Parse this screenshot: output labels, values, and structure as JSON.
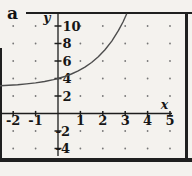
{
  "figure_label": "a",
  "colors": {
    "paper": "#f4f2ee",
    "ink": "#1d1d1d",
    "curve": "#4d4d4d",
    "grid_dot": "#777777"
  },
  "chart_data": {
    "type": "line",
    "title": "",
    "xlabel": "x",
    "ylabel": "y",
    "x_axis_range": [
      -2.6,
      5.6
    ],
    "y_axis_range": [
      -5.5,
      11.4
    ],
    "grid": "dotted points at integer x and even y intersections",
    "legend": "none",
    "x_ticks": [
      {
        "label": "-2",
        "value": -2
      },
      {
        "label": "-1",
        "value": -1
      },
      {
        "label": "1",
        "value": 1
      },
      {
        "label": "2",
        "value": 2
      },
      {
        "label": "3",
        "value": 3
      },
      {
        "label": "4",
        "value": 4
      },
      {
        "label": "5",
        "value": 5
      }
    ],
    "y_ticks": [
      {
        "label": "10",
        "value": 10
      },
      {
        "label": "8",
        "value": 8
      },
      {
        "label": "6",
        "value": 6
      },
      {
        "label": "4",
        "value": 4
      },
      {
        "label": "2",
        "value": 2
      },
      {
        "label": "-2",
        "value": -2
      },
      {
        "label": "-4",
        "value": -4
      }
    ],
    "series": [
      {
        "name": "exponential curve",
        "function": "y = 2^x + 3",
        "horizontal_asymptote": 3,
        "y_intercept": 4,
        "points": [
          [
            -2.63,
            3.16
          ],
          [
            -2.2,
            3.22
          ],
          [
            -1.8,
            3.29
          ],
          [
            -1.4,
            3.38
          ],
          [
            -1.0,
            3.5
          ],
          [
            -0.6,
            3.66
          ],
          [
            -0.2,
            3.87
          ],
          [
            0,
            4
          ],
          [
            0.3,
            4.23
          ],
          [
            0.6,
            4.52
          ],
          [
            0.9,
            4.87
          ],
          [
            1.2,
            5.3
          ],
          [
            1.5,
            5.83
          ],
          [
            1.8,
            6.48
          ],
          [
            2.1,
            7.29
          ],
          [
            2.4,
            8.28
          ],
          [
            2.7,
            9.5
          ],
          [
            2.9,
            10.46
          ],
          [
            3.06,
            11.34
          ]
        ]
      }
    ]
  }
}
